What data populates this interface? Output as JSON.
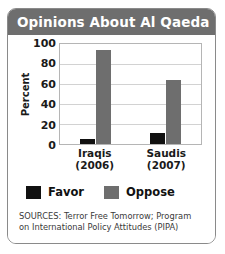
{
  "card": {
    "title": "Opinions About Al Qaeda",
    "header_color": "#6e6e6e",
    "border_color": "#8a8a8a"
  },
  "legend": {
    "items": [
      {
        "label": "Favor",
        "color": "#111111"
      },
      {
        "label": "Oppose",
        "color": "#6e6e6e"
      }
    ]
  },
  "sources": {
    "line1": "SOURCES: Terror Free Tomorrow; Program",
    "line2": "on International Policy Attitudes (PIPA)"
  },
  "chart_data": {
    "type": "bar",
    "title": "Opinions About Al Qaeda",
    "xlabel": "",
    "ylabel": "Percent",
    "ylim": [
      0,
      100
    ],
    "yticks": [
      100,
      80,
      60,
      40,
      20,
      0
    ],
    "grid": true,
    "legend_position": "bottom-left",
    "categories": [
      "Iraqis (2006)",
      "Saudis (2007)"
    ],
    "category_lines": [
      [
        "Iraqis",
        "(2006)"
      ],
      [
        "Saudis",
        "(2007)"
      ]
    ],
    "series": [
      {
        "name": "Favor",
        "color": "#111111",
        "values": [
          5,
          11
        ]
      },
      {
        "name": "Oppose",
        "color": "#6e6e6e",
        "values": [
          94,
          64
        ]
      }
    ]
  }
}
